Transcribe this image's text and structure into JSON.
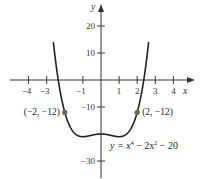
{
  "chart_data": {
    "type": "line",
    "title": "",
    "xlabel": "x",
    "ylabel": "y",
    "xlim": [
      -4.5,
      5
    ],
    "ylim": [
      -33,
      28
    ],
    "grid": false,
    "function": "y = x^4 - 2x^2 - 20",
    "equation_label": {
      "prefix": "y = x",
      "exp1": "4",
      "mid": " − 2x",
      "exp2": "2",
      "suffix": " − 20"
    },
    "x_ticks": [
      -4,
      -3,
      -1,
      1,
      2,
      3,
      4
    ],
    "x_tick_labels": [
      "−4",
      "−3",
      "−1",
      "1",
      "2",
      "3",
      "4"
    ],
    "y_ticks": [
      20,
      10,
      -10,
      -30
    ],
    "y_tick_labels": [
      "20",
      "10",
      "−10",
      "−30"
    ],
    "series": [
      {
        "name": "y = x^4 - 2x^2 - 20",
        "x": [
          -2.6,
          -2.4,
          -2.2,
          -2,
          -1.5,
          -1,
          -0.5,
          0,
          0.5,
          1,
          1.5,
          2,
          2.2,
          2.4,
          2.6
        ],
        "y": [
          12.2,
          1.7,
          -6.3,
          -12,
          -19.4,
          -21,
          -20.4,
          -20,
          -20.4,
          -21,
          -19.4,
          -12,
          -6.3,
          1.7,
          12.2
        ]
      }
    ],
    "annotations": [
      {
        "x": -2,
        "y": -12,
        "label": "(−2, −12)"
      },
      {
        "x": 2,
        "y": -12,
        "label": "(2, −12)"
      }
    ],
    "colors": {
      "curve": "#222222",
      "axis": "#333333",
      "point": "#666666"
    }
  }
}
